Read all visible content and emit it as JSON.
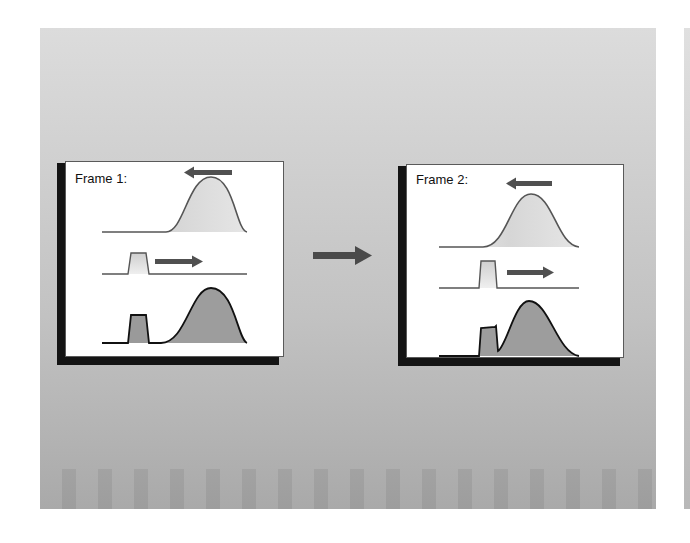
{
  "slide": {
    "background_top": "#dcdcdc",
    "background_bottom": "#a9a9a9"
  },
  "frames": [
    {
      "title": "Frame 1:",
      "top_wave_direction": "left",
      "pulse_direction": "right",
      "bottom_wave": "separated pulse and gaussian"
    },
    {
      "title": "Frame 2:",
      "top_wave_direction": "left",
      "pulse_direction": "right",
      "bottom_wave": "overlapping pulse and gaussian"
    }
  ],
  "transition_arrow": {
    "icon": "right-arrow-icon",
    "color": "#4a4a4a"
  },
  "colors": {
    "curve_stroke": "#555555",
    "light_fill": "#d9d9d9",
    "dark_fill": "#9a9a9a",
    "arrow": "#505050",
    "shadow": "#141414"
  }
}
